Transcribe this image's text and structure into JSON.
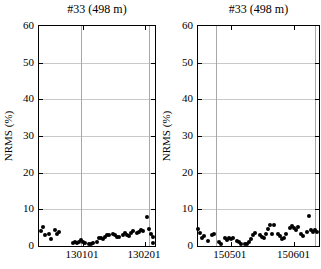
{
  "figure": {
    "background": "#ffffff",
    "text_color": "#000000"
  },
  "chart_data": [
    {
      "type": "scatter",
      "title": "#33 (498 m)",
      "ylabel": "NRMS (%)",
      "ylim": [
        0,
        60
      ],
      "yticks": [
        0,
        10,
        20,
        30,
        40,
        50,
        60
      ],
      "x_range": [
        "121210",
        "130206"
      ],
      "xticks": [
        "130101",
        "130201"
      ],
      "event_lines": [
        "121231",
        "130203"
      ],
      "grid": "horizontal",
      "legend": "none",
      "colors": {
        "marker": "#000000",
        "grid": "#c9c9c9",
        "event_line": "#a8a8a8",
        "axis": "#000000"
      },
      "marker": {
        "shape": "circle",
        "size_px": 4
      },
      "points": [
        [
          "121211",
          4.0
        ],
        [
          "121212",
          5.1
        ],
        [
          "121213",
          2.9
        ],
        [
          "121215",
          3.4
        ],
        [
          "121216",
          2.0
        ],
        [
          "121218",
          4.3
        ],
        [
          "121219",
          3.3
        ],
        [
          "121220",
          3.7
        ],
        [
          "121227",
          0.9
        ],
        [
          "121228",
          1.0
        ],
        [
          "121229",
          0.8
        ],
        [
          "121230",
          1.2
        ],
        [
          "121231",
          1.6
        ],
        [
          "130101",
          1.1
        ],
        [
          "130102",
          0.8
        ],
        [
          "130104",
          0.5
        ],
        [
          "130105",
          0.5
        ],
        [
          "130106",
          0.8
        ],
        [
          "130108",
          1.1
        ],
        [
          "130109",
          2.1
        ],
        [
          "130110",
          2.3
        ],
        [
          "130111",
          1.8
        ],
        [
          "130112",
          2.5
        ],
        [
          "130113",
          3.0
        ],
        [
          "130114",
          2.9
        ],
        [
          "130116",
          3.2
        ],
        [
          "130117",
          2.9
        ],
        [
          "130118",
          2.5
        ],
        [
          "130119",
          2.4
        ],
        [
          "130121",
          2.9
        ],
        [
          "130122",
          3.6
        ],
        [
          "130123",
          3.1
        ],
        [
          "130124",
          2.7
        ],
        [
          "130125",
          3.5
        ],
        [
          "130126",
          4.1
        ],
        [
          "130128",
          3.5
        ],
        [
          "130129",
          3.9
        ],
        [
          "130130",
          4.5
        ],
        [
          "130131",
          4.1
        ],
        [
          "130202",
          8.0
        ],
        [
          "130203",
          4.6
        ],
        [
          "130204",
          3.4
        ],
        [
          "130205",
          2.5
        ],
        [
          "130205",
          0.8
        ]
      ]
    },
    {
      "type": "scatter",
      "title": "#33 (498 m)",
      "ylabel": "NRMS (%)",
      "ylim": [
        0,
        60
      ],
      "yticks": [
        0,
        10,
        20,
        30,
        40,
        50,
        60
      ],
      "x_range": [
        "150415",
        "150613"
      ],
      "xticks": [
        "150501",
        "150601"
      ],
      "event_lines": [
        "150424",
        "150611"
      ],
      "grid": "horizontal",
      "legend": "none",
      "colors": {
        "marker": "#000000",
        "grid": "#c9c9c9",
        "event_line": "#a8a8a8",
        "axis": "#000000"
      },
      "marker": {
        "shape": "circle",
        "size_px": 4
      },
      "points": [
        [
          "150415",
          4.6
        ],
        [
          "150416",
          3.5
        ],
        [
          "150417",
          2.1
        ],
        [
          "150418",
          2.8
        ],
        [
          "150420",
          1.5
        ],
        [
          "150422",
          3.0
        ],
        [
          "150423",
          3.2
        ],
        [
          "150425",
          1.2
        ],
        [
          "150426",
          0.6
        ],
        [
          "150428",
          2.3
        ],
        [
          "150429",
          1.7
        ],
        [
          "150430",
          2.1
        ],
        [
          "150501",
          1.9
        ],
        [
          "150502",
          2.1
        ],
        [
          "150504",
          1.5
        ],
        [
          "150505",
          1.0
        ],
        [
          "150506",
          0.6
        ],
        [
          "150508",
          0.5
        ],
        [
          "150509",
          0.6
        ],
        [
          "150510",
          1.0
        ],
        [
          "150511",
          1.9
        ],
        [
          "150512",
          3.0
        ],
        [
          "150513",
          3.5
        ],
        [
          "150515",
          3.0
        ],
        [
          "150516",
          2.4
        ],
        [
          "150517",
          2.3
        ],
        [
          "150518",
          3.4
        ],
        [
          "150519",
          4.6
        ],
        [
          "150520",
          5.7
        ],
        [
          "150521",
          3.4
        ],
        [
          "150522",
          5.7
        ],
        [
          "150524",
          3.2
        ],
        [
          "150525",
          2.6
        ],
        [
          "150526",
          1.9
        ],
        [
          "150527",
          2.3
        ],
        [
          "150528",
          3.2
        ],
        [
          "150530",
          4.8
        ],
        [
          "150531",
          5.5
        ],
        [
          "150601",
          5.0
        ],
        [
          "150602",
          4.4
        ],
        [
          "150603",
          5.3
        ],
        [
          "150604",
          3.4
        ],
        [
          "150605",
          2.8
        ],
        [
          "150607",
          3.9
        ],
        [
          "150608",
          8.1
        ],
        [
          "150609",
          4.4
        ],
        [
          "150610",
          3.7
        ],
        [
          "150611",
          4.3
        ],
        [
          "150612",
          3.7
        ]
      ]
    }
  ]
}
